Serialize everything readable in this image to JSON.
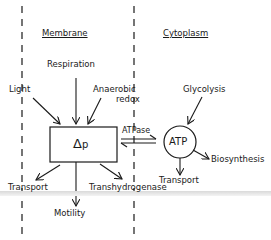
{
  "diagram": {
    "regions": {
      "membrane": "Membrane",
      "cytoplasm": "Cytoplasm"
    },
    "nodes": {
      "delta_p": {
        "symbol": "Δ",
        "subscript": "p"
      },
      "atp": "ATP"
    },
    "inputs_to_delta_p": [
      "Light",
      "Respiration",
      "Anaerobic",
      "redox"
    ],
    "outputs_from_delta_p": [
      "Transport",
      "Motility",
      "Transhydrogenase"
    ],
    "coupling": "ATPase",
    "inputs_to_atp": [
      "Glycolysis"
    ],
    "outputs_from_atp": [
      "Biosynthesis",
      "Transport"
    ]
  },
  "colors": {
    "ink": "#1a1a1a",
    "background": "#ffffff",
    "band": "#d9d9d9"
  }
}
